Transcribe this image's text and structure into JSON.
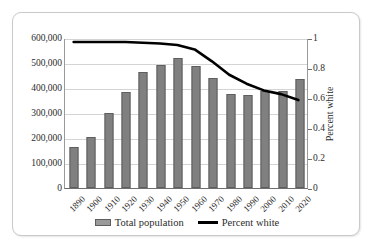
{
  "chart_data": {
    "type": "bar",
    "title": "",
    "xlabel": "",
    "ylabel": "",
    "grid": true,
    "legend_position": "bottom",
    "categories": [
      "1890",
      "1900",
      "1910",
      "1920",
      "1930",
      "1940",
      "1950",
      "1960",
      "1970",
      "1980",
      "1990",
      "2000",
      "2010",
      "2020"
    ],
    "series": [
      {
        "name": "Total population",
        "type": "bar",
        "axis": "left",
        "color": "#808080",
        "values": [
          165000,
          203000,
          302000,
          383000,
          465000,
          494000,
          522000,
          488000,
          440000,
          378000,
          374000,
          390000,
          390000,
          437000
        ]
      },
      {
        "name": "Percent white",
        "type": "line",
        "axis": "right",
        "color": "#000000",
        "values": [
          0.98,
          0.98,
          0.98,
          0.98,
          0.975,
          0.97,
          0.96,
          0.93,
          0.85,
          0.76,
          0.7,
          0.655,
          0.63,
          0.59
        ]
      }
    ],
    "left_axis": {
      "label": "",
      "ylim": [
        0,
        600000
      ],
      "ticks": [
        0,
        100000,
        200000,
        300000,
        400000,
        500000,
        600000
      ],
      "tick_labels": [
        "0",
        "100,000",
        "200,000",
        "300,000",
        "400,000",
        "500,000",
        "600,000"
      ]
    },
    "right_axis": {
      "label": "Percent white",
      "ylim": [
        0,
        1
      ],
      "ticks": [
        0,
        0.2,
        0.4,
        0.6,
        0.8,
        1
      ],
      "tick_labels": [
        "0",
        "0.2",
        "0.4",
        "0.6",
        "0.8",
        "1"
      ]
    },
    "legend": [
      {
        "label": "Total population",
        "marker": "bar",
        "color": "#808080"
      },
      {
        "label": "Percent white",
        "marker": "line",
        "color": "#000000"
      }
    ]
  }
}
